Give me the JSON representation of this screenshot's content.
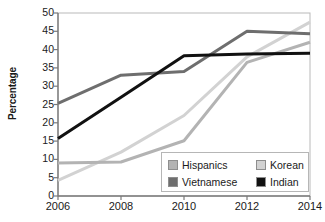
{
  "chart_data": {
    "type": "line",
    "title": "",
    "xlabel": "",
    "ylabel": "Percentage",
    "x": [
      2006,
      2008,
      2010,
      2012,
      2014
    ],
    "categories": [
      "2006",
      "2008",
      "2010",
      "2012",
      "2014"
    ],
    "xlim": [
      2006,
      2014
    ],
    "ylim": [
      0,
      50
    ],
    "ytick_labels": [
      "0",
      "5",
      "10",
      "15",
      "20",
      "25",
      "30",
      "35",
      "40",
      "45",
      "50"
    ],
    "ytick_values": [
      0,
      5,
      10,
      15,
      20,
      25,
      30,
      35,
      40,
      45,
      50
    ],
    "xtick_labels": [
      "2006",
      "2008",
      "2010",
      "2012",
      "2014"
    ],
    "grid": false,
    "legend_position": "inside-bottom-right",
    "series": [
      {
        "name": "Hispanics",
        "color": "#b3b3b3",
        "values": [
          9.0,
          9.3,
          15.1,
          36.5,
          42.0
        ]
      },
      {
        "name": "Korean",
        "color": "#d2d2d2",
        "values": [
          4.3,
          12.0,
          22.0,
          38.0,
          47.5
        ]
      },
      {
        "name": "Vietnamese",
        "color": "#6e6e6e",
        "values": [
          25.3,
          33.0,
          34.0,
          45.0,
          44.3
        ]
      },
      {
        "name": "Indian",
        "color": "#111111",
        "values": [
          15.7,
          27.0,
          38.3,
          38.8,
          39.0
        ]
      }
    ]
  },
  "legend": {
    "entries": [
      {
        "label": "Hispanics",
        "swatch": "#b3b3b3"
      },
      {
        "label": "Korean",
        "swatch": "#d2d2d2"
      },
      {
        "label": "Vietnamese",
        "swatch": "#6e6e6e"
      },
      {
        "label": "Indian",
        "swatch": "#111111"
      }
    ]
  },
  "axes": {
    "y_title": "Percentage"
  },
  "colors": {
    "axis": "#7a7a7a",
    "text": "#1a1a1a",
    "background": "#ffffff",
    "legend_border": "#b6b6b6"
  }
}
